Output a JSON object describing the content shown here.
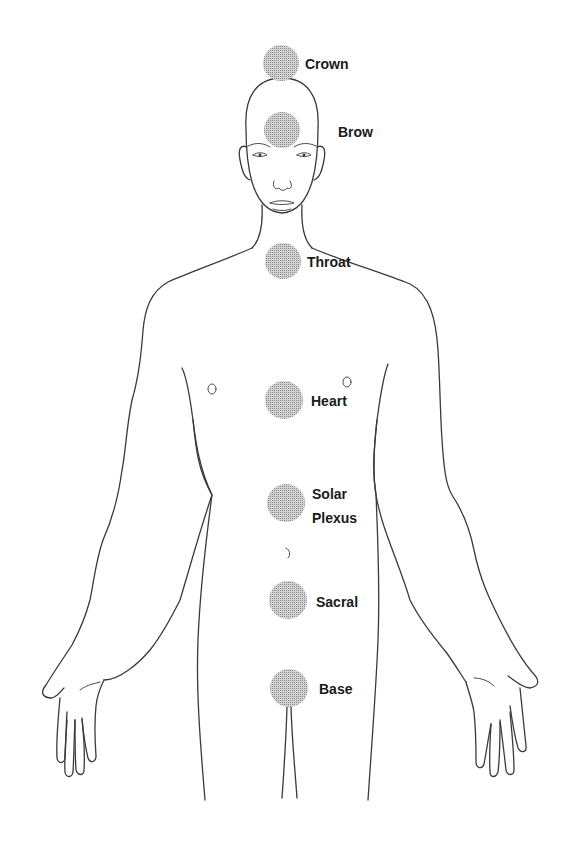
{
  "diagram": {
    "type": "chakra body map",
    "colors": {
      "line": "#3a3a3a",
      "chakra_fill": "#b9b9b9",
      "label": "#1a1a1a",
      "background": "#ffffff"
    },
    "chakras": [
      {
        "name": "crown",
        "label": "Crown"
      },
      {
        "name": "brow",
        "label": "Brow"
      },
      {
        "name": "throat",
        "label": "Throat"
      },
      {
        "name": "heart",
        "label": "Heart"
      },
      {
        "name": "solar-plexus",
        "label_line1": "Solar",
        "label_line2": "Plexus"
      },
      {
        "name": "sacral",
        "label": "Sacral"
      },
      {
        "name": "base",
        "label": "Base"
      }
    ]
  }
}
